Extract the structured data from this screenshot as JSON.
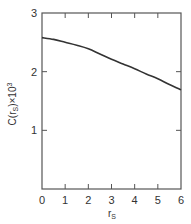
{
  "chart_data": {
    "type": "line",
    "title": "",
    "xlabel": "r_s",
    "ylabel": "C(r_s)×10^3",
    "xlim": [
      0,
      6
    ],
    "ylim": [
      0,
      3
    ],
    "xticks": [
      0,
      1,
      2,
      3,
      4,
      5,
      6
    ],
    "yticks": [
      0,
      1,
      2,
      3
    ],
    "grid": false,
    "legend": null,
    "series": [
      {
        "name": "C(r_s)",
        "x": [
          0,
          0.5,
          1,
          1.5,
          2,
          2.5,
          3,
          3.5,
          4,
          4.5,
          5,
          5.5,
          6
        ],
        "y": [
          2.58,
          2.55,
          2.5,
          2.45,
          2.39,
          2.3,
          2.21,
          2.13,
          2.05,
          1.96,
          1.88,
          1.78,
          1.69
        ]
      }
    ]
  },
  "labels": {
    "x_axis": "r",
    "x_axis_sub": "S",
    "y_axis": "C(r",
    "y_axis_sub": "S",
    "y_axis_tail": ")×10",
    "y_axis_sup": "3"
  },
  "colors": {
    "line": "#333333",
    "axis": "#555555"
  }
}
